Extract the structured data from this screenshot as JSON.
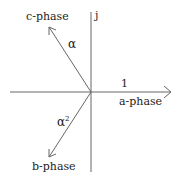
{
  "diagram": {
    "type": "phasor",
    "axis_vertical_label": "j",
    "phasors": [
      {
        "name": "a-phase",
        "operator": "1",
        "angle_deg": 0
      },
      {
        "name": "b-phase",
        "operator": "α",
        "operator_sup": "2",
        "angle_deg": 240
      },
      {
        "name": "c-phase",
        "operator": "α",
        "angle_deg": 120
      }
    ],
    "colors": {
      "line": "#555555",
      "text": "#222222",
      "background": "#ffffff"
    }
  }
}
